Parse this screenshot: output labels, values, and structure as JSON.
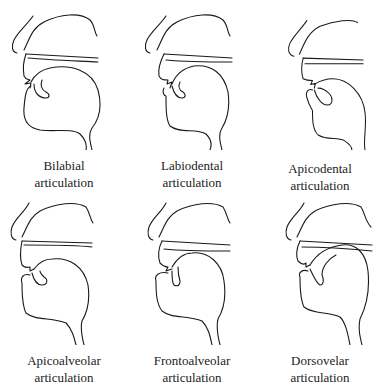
{
  "figure": {
    "panels": [
      {
        "id": "bilabial",
        "line1": "Bilabial",
        "line2": "articulation"
      },
      {
        "id": "labiodental",
        "line1": "Labiodental",
        "line2": "articulation"
      },
      {
        "id": "apicodental",
        "line1": "Apicodental",
        "line2": "articulation"
      },
      {
        "id": "apicoalveolar",
        "line1": "Apicoalveolar",
        "line2": "articulation"
      },
      {
        "id": "frontoalveolar",
        "line1": "Frontoalveolar",
        "line2": "articulation"
      },
      {
        "id": "dorsovelar",
        "line1": "Dorsovelar",
        "line2": "articulation"
      }
    ]
  }
}
